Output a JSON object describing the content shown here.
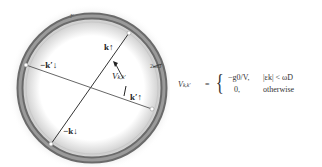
{
  "diagram": {
    "shell_label": "F",
    "shell_width_label": "2ωD",
    "pairs": [
      {
        "from_label": "k↑",
        "to_label": "−k↓"
      },
      {
        "from_label": "k′↑",
        "to_label": "−k′↓"
      }
    ],
    "interaction_label": "V",
    "interaction_subscript": "k,k′",
    "labels": {
      "k_up": "k↑",
      "minus_k_down": "−k↓",
      "kprime_up": "k′↑",
      "minus_kprime_down": "−k′↓"
    },
    "colors": {
      "shell_dark": "#555555",
      "shell_mid": "#8a8a8a",
      "shell_light": "#d0d0d0",
      "line": "#333333",
      "glow": "#bdbdbd"
    }
  },
  "equation": {
    "lhs": "V",
    "lhs_sub": "k,k′",
    "equals": "=",
    "case1_value": "−g0/V,",
    "case1_condition": "|εk| < ωD",
    "case2_value": "0,",
    "case2_condition": "otherwise"
  }
}
